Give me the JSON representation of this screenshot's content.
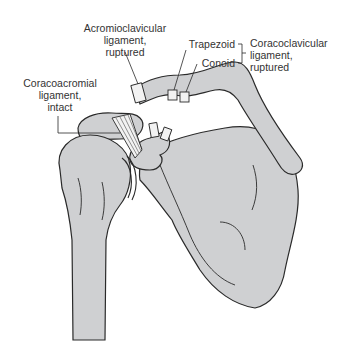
{
  "labels": {
    "acromioclavicular": {
      "line1": "Acromioclavicular",
      "line2": "ligament,",
      "line3": "ruptured"
    },
    "trapezoid": "Trapezoid",
    "conoid": "Conoid",
    "coracoclavicular": {
      "line1": "Coracoclavicular",
      "line2": "ligament,",
      "line3": "ruptured"
    },
    "coracoacromial": {
      "line1": "Coracoacromial",
      "line2": "ligament,",
      "line3": "intact"
    }
  },
  "colors": {
    "bone_fill": "#cfd0d2",
    "outline": "#2a2a2a",
    "ligament_fill": "#f2f2f2",
    "text": "#333333"
  }
}
